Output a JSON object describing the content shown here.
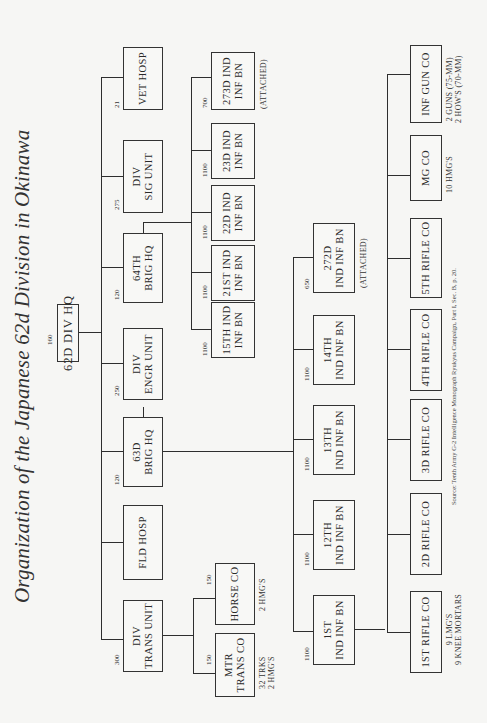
{
  "title": "Organization of the Japanese 62d Division in Okinawa",
  "hq": {
    "label": "62D DIV HQ",
    "strength": "160"
  },
  "level1": [
    {
      "id": "div-trans-unit",
      "lines": [
        "DIV",
        "TRANS UNIT"
      ],
      "strength": "300"
    },
    {
      "id": "fld-hosp",
      "lines": [
        "FLD HOSP"
      ],
      "strength": ""
    },
    {
      "id": "63d-brig-hq",
      "lines": [
        "63D",
        "BRIG HQ"
      ],
      "strength": "120"
    },
    {
      "id": "div-engr-unit",
      "lines": [
        "DIV",
        "ENGR UNIT"
      ],
      "strength": "250"
    },
    {
      "id": "64th-brig-hq",
      "lines": [
        "64TH",
        "BRIG HQ"
      ],
      "strength": "120"
    },
    {
      "id": "div-sig-unit",
      "lines": [
        "DIV",
        "SIG UNIT"
      ],
      "strength": "275"
    },
    {
      "id": "vet-hosp",
      "lines": [
        "VET HOSP"
      ],
      "strength": "21"
    }
  ],
  "trans_unit_children": [
    {
      "id": "mtr-trans-co",
      "lines": [
        "MTR",
        "TRANS CO"
      ],
      "strength": "150",
      "note": [
        "32 TRKS",
        "2 HMG'S"
      ]
    },
    {
      "id": "horse-co",
      "lines": [
        "HORSE CO"
      ],
      "strength": "150",
      "note": [
        "2 HMG'S"
      ]
    }
  ],
  "brig64_children": [
    {
      "id": "15th-ind-inf-bn",
      "lines": [
        "15TH IND",
        "INF BN"
      ],
      "strength": "1100"
    },
    {
      "id": "21st-ind-inf-bn",
      "lines": [
        "21ST IND",
        "INF BN"
      ],
      "strength": "1100"
    },
    {
      "id": "22d-ind-inf-bn",
      "lines": [
        "22D IND",
        "INF BN"
      ],
      "strength": "1100"
    },
    {
      "id": "23d-ind-inf-bn",
      "lines": [
        "23D IND",
        "INF BN"
      ],
      "strength": "1100"
    },
    {
      "id": "273d-ind-inf-bn",
      "lines": [
        "273D IND",
        "INF BN"
      ],
      "strength": "700",
      "note": [
        "(ATTACHED)"
      ]
    }
  ],
  "brig63_children": [
    {
      "id": "1st-ind-inf-bn",
      "lines": [
        "1ST",
        "IND INF BN"
      ],
      "strength": "1100"
    },
    {
      "id": "12th-ind-inf-bn",
      "lines": [
        "12TH",
        "IND INF BN"
      ],
      "strength": "1100"
    },
    {
      "id": "13th-ind-inf-bn",
      "lines": [
        "13TH",
        "IND INF BN"
      ],
      "strength": "1100"
    },
    {
      "id": "14th-ind-inf-bn",
      "lines": [
        "14TH",
        "IND INF BN"
      ],
      "strength": "1100"
    },
    {
      "id": "272d-ind-inf-bn",
      "lines": [
        "272D",
        "IND INF BN"
      ],
      "strength": "650",
      "note": [
        "(ATTACHED)"
      ]
    }
  ],
  "battalion_children": [
    {
      "id": "1st-rifle-co",
      "lines": [
        "1ST RIFLE CO"
      ],
      "note": [
        "9 LMG'S",
        "9 KNEE MORTARS"
      ]
    },
    {
      "id": "2d-rifle-co",
      "lines": [
        "2D RIFLE CO"
      ]
    },
    {
      "id": "3d-rifle-co",
      "lines": [
        "3D RIFLE CO"
      ]
    },
    {
      "id": "4th-rifle-co",
      "lines": [
        "4TH RIFLE CO"
      ]
    },
    {
      "id": "5th-rifle-co",
      "lines": [
        "5TH RIFLE CO"
      ]
    },
    {
      "id": "mg-co",
      "lines": [
        "MG CO"
      ],
      "note": [
        "10 HMG'S"
      ]
    },
    {
      "id": "inf-gun-co",
      "lines": [
        "INF GUN CO"
      ],
      "note": [
        "2 GUNS (75-MM)",
        "2 HOW'S (70-MM)"
      ]
    }
  ],
  "source": "Source: Tenth Army G-2 Intelligence Monograph Ryukyus Campaign, Part I, Sec. B, p. 20."
}
